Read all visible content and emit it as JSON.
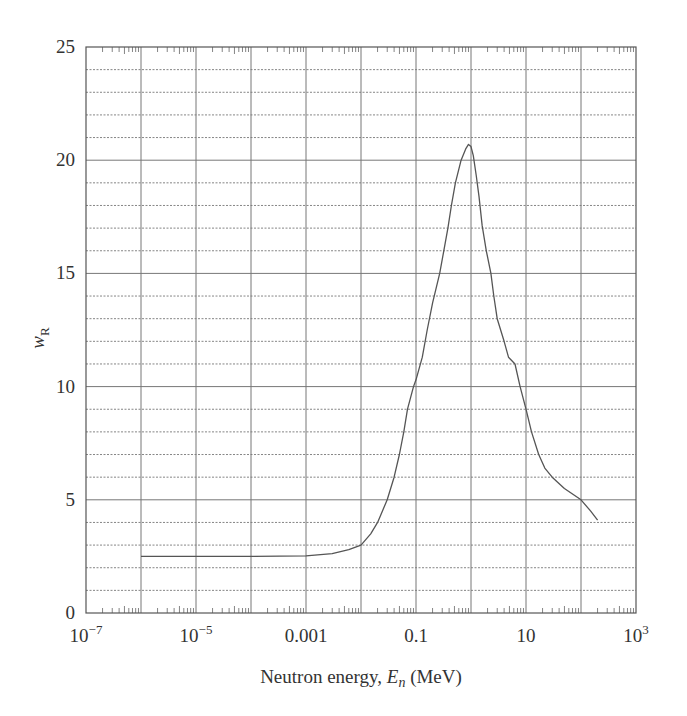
{
  "chart_data": {
    "type": "line",
    "title": "",
    "xlabel": "Neutron energy, E_n (MeV)",
    "xlabel_parts": {
      "prefix": "Neutron energy, ",
      "var": "E",
      "sub": "n",
      "suffix": " (MeV)"
    },
    "ylabel": "w_R",
    "ylabel_parts": {
      "var": "w",
      "sub": "R"
    },
    "xscale": "log",
    "xlim": [
      1e-07,
      1000
    ],
    "ylim": [
      0,
      25
    ],
    "grid": {
      "major_x": "every decade",
      "major_y": 5,
      "minor_y": 1,
      "minor_y_style": "dashed"
    },
    "x_tick_labels": [
      {
        "value": 1e-07,
        "base": "10",
        "exp": "−7"
      },
      {
        "value": 1e-05,
        "base": "10",
        "exp": "−5"
      },
      {
        "value": 0.001,
        "base": "0.001",
        "exp": ""
      },
      {
        "value": 0.1,
        "base": "0.1",
        "exp": ""
      },
      {
        "value": 10,
        "base": "10",
        "exp": ""
      },
      {
        "value": 1000,
        "base": "10",
        "exp": "3"
      }
    ],
    "y_tick_labels": [
      {
        "value": 0,
        "label": "0"
      },
      {
        "value": 5,
        "label": "5"
      },
      {
        "value": 10,
        "label": "10"
      },
      {
        "value": 15,
        "label": "15"
      },
      {
        "value": 20,
        "label": "20"
      },
      {
        "value": 25,
        "label": "25"
      }
    ],
    "series": [
      {
        "name": "w_R",
        "x": [
          1e-06,
          1e-05,
          0.0001,
          0.001,
          0.003,
          0.006,
          0.01,
          0.015,
          0.02,
          0.03,
          0.04,
          0.05,
          0.06,
          0.07,
          0.09,
          0.1,
          0.13,
          0.16,
          0.2,
          0.27,
          0.32,
          0.38,
          0.44,
          0.52,
          0.66,
          0.8,
          0.9,
          1.0,
          1.1,
          1.25,
          1.4,
          1.6,
          1.9,
          2.3,
          2.6,
          3.0,
          4.0,
          4.8,
          6.3,
          7.8,
          10,
          12.6,
          17,
          22,
          30,
          50,
          100,
          150,
          200
        ],
        "y": [
          2.5,
          2.5,
          2.5,
          2.52,
          2.62,
          2.8,
          3.0,
          3.5,
          4.0,
          5.0,
          6.0,
          7.0,
          8.0,
          9.0,
          10.0,
          10.3,
          11.3,
          12.5,
          13.7,
          15.0,
          16.0,
          17.0,
          18.0,
          19.0,
          20.0,
          20.5,
          20.7,
          20.6,
          20.2,
          19.3,
          18.4,
          17.1,
          16.0,
          15.0,
          14.0,
          13.0,
          12.0,
          11.3,
          11.0,
          10.0,
          9.0,
          8.0,
          7.0,
          6.4,
          6.0,
          5.5,
          5.0,
          4.5,
          4.1
        ]
      }
    ],
    "line_color": "#555555",
    "grid_color": "#777777",
    "legend": null
  }
}
